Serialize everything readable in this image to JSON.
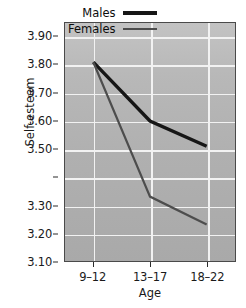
{
  "chart_data": {
    "type": "line",
    "title": "",
    "xlabel": "Age",
    "ylabel": "Self-esteem",
    "categories": [
      "9–12",
      "13–17",
      "18–22"
    ],
    "series": [
      {
        "name": "Males",
        "values": [
          3.81,
          3.6,
          3.51
        ],
        "color": "#161616",
        "line_width": 3.4
      },
      {
        "name": "Females",
        "values": [
          3.81,
          3.33,
          3.23
        ],
        "color": "#4d4d4d",
        "line_width": 2.2
      }
    ],
    "ylim": [
      3.1,
      3.95
    ],
    "ytick_values": [
      3.9,
      3.8,
      3.7,
      3.6,
      3.5,
      3.4,
      3.3,
      3.2,
      3.1
    ],
    "ytick_labels": [
      "3.90",
      "3.80",
      "3.70",
      "3.60",
      "3.50",
      "",
      "3.30",
      "3.20",
      "3.10"
    ],
    "grid": true,
    "legend_position": "top-right-inside",
    "plot_background": "#b0b0b0",
    "gridline_color": "#f2f2f2",
    "axis_color": "#4a4a4a"
  },
  "legend": {
    "entries": [
      {
        "label": "Males"
      },
      {
        "label": "Females"
      }
    ]
  },
  "axes": {
    "y_title": "Self-esteem",
    "x_title": "Age"
  }
}
